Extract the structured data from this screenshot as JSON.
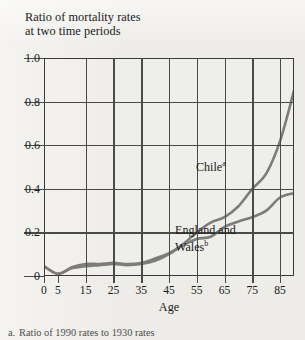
{
  "title": {
    "line1": "Ratio of mortality rates",
    "line2": "at two time periods"
  },
  "axes": {
    "y_ticks": [
      "1.0",
      "0.8",
      "0.6",
      "0.4",
      "0.2",
      "0"
    ],
    "x_ticks": [
      "0",
      "5",
      "15",
      "25",
      "35",
      "45",
      "55",
      "65",
      "75",
      "85"
    ],
    "x_title": "Age"
  },
  "annotations": {
    "chile": "Chile",
    "chile_marker": "a",
    "england_wales": "England and Wales",
    "england_wales_marker": "b"
  },
  "footnote": {
    "marker": "a.",
    "text": "Ratio of 1990 rates to 1930 rates"
  },
  "colors": {
    "page_background": "#edece9",
    "axis": "#4a4a47",
    "frame": "#3a3a38",
    "series": "#6e6e6b",
    "text": "#1a1a18"
  },
  "chart_data": {
    "type": "line",
    "title": "Ratio of mortality rates at two time periods",
    "xlabel": "Age",
    "ylabel": "Ratio of mortality rates at two time periods",
    "xlim": [
      0,
      90
    ],
    "ylim": [
      0,
      1.0
    ],
    "x_tick_values": [
      0,
      5,
      15,
      25,
      35,
      45,
      55,
      65,
      75,
      85
    ],
    "y_tick_values": [
      0,
      0.2,
      0.4,
      0.6,
      0.8,
      1.0
    ],
    "grid": "both",
    "legend": "in-plot annotations",
    "series": [
      {
        "name": "Chile",
        "footnote_marker": "a",
        "x": [
          0,
          5,
          10,
          15,
          20,
          25,
          30,
          35,
          40,
          45,
          50,
          55,
          60,
          65,
          70,
          75,
          80,
          85,
          90
        ],
        "y": [
          0.045,
          0.01,
          0.035,
          0.045,
          0.05,
          0.055,
          0.05,
          0.055,
          0.07,
          0.1,
          0.145,
          0.2,
          0.245,
          0.27,
          0.32,
          0.4,
          0.47,
          0.62,
          0.85
        ]
      },
      {
        "name": "England and Wales",
        "footnote_marker": "b",
        "x": [
          0,
          5,
          10,
          15,
          20,
          25,
          30,
          35,
          40,
          45,
          50,
          55,
          60,
          65,
          70,
          75,
          80,
          85,
          90
        ],
        "y": [
          0.045,
          0.01,
          0.04,
          0.055,
          0.055,
          0.06,
          0.055,
          0.06,
          0.08,
          0.105,
          0.14,
          0.17,
          0.18,
          0.225,
          0.25,
          0.27,
          0.3,
          0.36,
          0.38
        ]
      }
    ]
  }
}
